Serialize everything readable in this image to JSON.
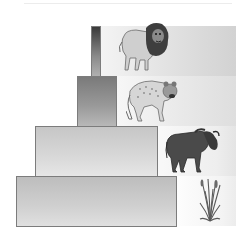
{
  "diagram": {
    "type": "ecological-pyramid",
    "levels": [
      {
        "name": "tertiary-consumer",
        "organism": "lion",
        "icon": "lion-icon"
      },
      {
        "name": "secondary-consumer",
        "organism": "hyena",
        "icon": "hyena-icon"
      },
      {
        "name": "primary-consumer",
        "organism": "wildebeest",
        "icon": "wildebeest-icon"
      },
      {
        "name": "producer",
        "organism": "grass",
        "icon": "grass-icon"
      }
    ]
  }
}
